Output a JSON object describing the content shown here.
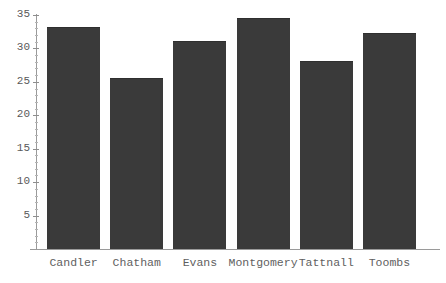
{
  "chart_data": {
    "type": "bar",
    "title": "",
    "xlabel": "",
    "ylabel": "",
    "categories": [
      "Candler",
      "Chatham",
      "Evans",
      "Montgomery",
      "Tattnall",
      "Toombs"
    ],
    "values": [
      33.0,
      25.4,
      31.0,
      34.4,
      28.0,
      32.2
    ],
    "ylim": [
      0,
      36
    ],
    "yticks": [
      5,
      10,
      15,
      20,
      25,
      30,
      35
    ],
    "ytick_labels": [
      "5",
      "10",
      "15",
      "20",
      "25",
      "30",
      "35"
    ],
    "minor_tick_step": 1,
    "grid": false,
    "legend": false,
    "bar_color": "#3a3a3a",
    "axis_color": "#9a9a9a",
    "text_color": "#5a5a5a",
    "background": "#ffffff"
  },
  "axis": {
    "y_labels": [
      "35",
      "30",
      "25",
      "20",
      "15",
      "10",
      "5"
    ]
  },
  "x_axis": {
    "labels": [
      "Candler",
      "Chatham",
      "Evans",
      "Montgomery",
      "Tattnall",
      "Toombs"
    ]
  },
  "header": {
    "cropped_title": ""
  }
}
